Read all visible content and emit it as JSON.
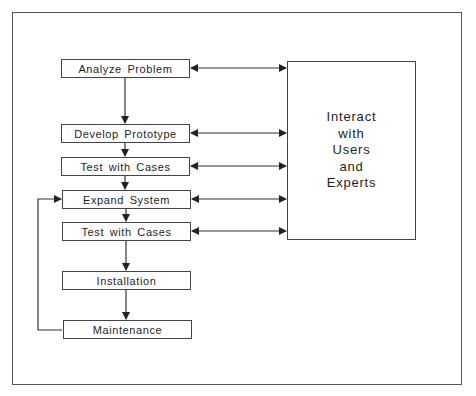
{
  "diagram": {
    "type": "flowchart",
    "steps": [
      {
        "id": "analyze",
        "label": "Analyze Problem"
      },
      {
        "id": "prototype",
        "label": "Develop Prototype"
      },
      {
        "id": "test1",
        "label": "Test with Cases"
      },
      {
        "id": "expand",
        "label": "Expand System"
      },
      {
        "id": "test2",
        "label": "Test with Cases"
      },
      {
        "id": "install",
        "label": "Installation"
      },
      {
        "id": "maintain",
        "label": "Maintenance"
      }
    ],
    "interact": {
      "lines": [
        "Interact",
        "with",
        "Users",
        "and",
        "Experts"
      ]
    },
    "edges": [
      {
        "from": "Analyze Problem",
        "to": "Develop Prototype"
      },
      {
        "from": "Develop Prototype",
        "to": "Test with Cases"
      },
      {
        "from": "Test with Cases",
        "to": "Expand System"
      },
      {
        "from": "Expand System",
        "to": "Test with Cases"
      },
      {
        "from": "Test with Cases",
        "to": "Installation"
      },
      {
        "from": "Installation",
        "to": "Maintenance"
      },
      {
        "from": "Maintenance",
        "to": "Expand System",
        "kind": "loop"
      }
    ],
    "bidirectional_links": [
      "Analyze Problem",
      "Develop Prototype",
      "Test with Cases",
      "Expand System",
      "Test with Cases"
    ]
  }
}
